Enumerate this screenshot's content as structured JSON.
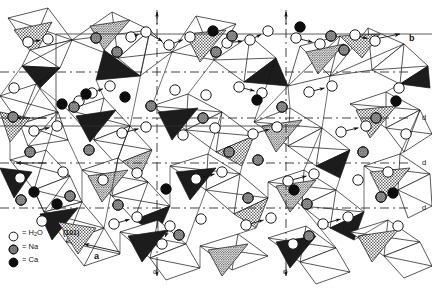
{
  "figure": {
    "type": "crystal-structure-projection",
    "width": 432,
    "height": 291,
    "background": "#ffffff",
    "line_color": "#111111"
  },
  "axes": {
    "a_label": "a",
    "b_label": "b",
    "a_position": {
      "x": 94,
      "y": 258
    },
    "b_position": {
      "x": 409,
      "y": 38
    }
  },
  "face_label": {
    "text": "(101)",
    "x": 67,
    "y": 232
  },
  "glide_labels": {
    "label": "d",
    "right_edge": [
      {
        "x": 422,
        "y": 68
      },
      {
        "x": 422,
        "y": 114
      },
      {
        "x": 422,
        "y": 159
      },
      {
        "x": 422,
        "y": 204
      }
    ],
    "bottom_edge": [
      {
        "x": 153,
        "y": 268
      },
      {
        "x": 283,
        "y": 268
      }
    ]
  },
  "glide_lines": {
    "horizontal_y": [
      72,
      118,
      163,
      208
    ],
    "vertical_x": [
      157,
      286
    ],
    "dash_pattern": "9 4 2 4",
    "color": "#222222"
  },
  "arrows": {
    "left_pointing": [
      {
        "x": 20,
        "y": 118
      },
      {
        "x": 20,
        "y": 163
      }
    ],
    "down_pointing": [
      {
        "x": 157,
        "y": 282
      },
      {
        "x": 286,
        "y": 282
      }
    ],
    "up_tick": [
      {
        "x": 157,
        "y": 14
      },
      {
        "x": 286,
        "y": 14
      }
    ]
  },
  "legend": {
    "items": [
      {
        "symbol": "open-circle",
        "eq": "=",
        "label": "H",
        "sub": "2",
        "label_tail": "O",
        "fill": "#ffffff",
        "stroke": "#111111"
      },
      {
        "symbol": "stippled-circle",
        "eq": "=",
        "label": "Na",
        "sub": "",
        "label_tail": "",
        "fill": "#5a5a5a",
        "stroke": "#111111"
      },
      {
        "symbol": "filled-circle",
        "eq": "=",
        "label": "Ca",
        "sub": "",
        "label_tail": "",
        "fill": "#0d0d0d",
        "stroke": "#0d0d0d"
      }
    ]
  },
  "atoms": {
    "h2o_color": "#ffffff",
    "na_color": "#555555",
    "ca_color": "#0d0d0d",
    "radius": 5.2,
    "h2o": [
      {
        "x": 28,
        "y": 42
      },
      {
        "x": 48,
        "y": 39
      },
      {
        "x": 79,
        "y": 101
      },
      {
        "x": 131,
        "y": 37
      },
      {
        "x": 146,
        "y": 32
      },
      {
        "x": 169,
        "y": 45
      },
      {
        "x": 190,
        "y": 37
      },
      {
        "x": 227,
        "y": 43
      },
      {
        "x": 250,
        "y": 40
      },
      {
        "x": 268,
        "y": 31
      },
      {
        "x": 296,
        "y": 38
      },
      {
        "x": 320,
        "y": 44
      },
      {
        "x": 355,
        "y": 35
      },
      {
        "x": 375,
        "y": 41
      },
      {
        "x": 14,
        "y": 88
      },
      {
        "x": 92,
        "y": 93
      },
      {
        "x": 110,
        "y": 86
      },
      {
        "x": 175,
        "y": 90
      },
      {
        "x": 206,
        "y": 95
      },
      {
        "x": 239,
        "y": 87
      },
      {
        "x": 262,
        "y": 93
      },
      {
        "x": 309,
        "y": 92
      },
      {
        "x": 332,
        "y": 86
      },
      {
        "x": 399,
        "y": 88
      },
      {
        "x": 34,
        "y": 131
      },
      {
        "x": 57,
        "y": 126
      },
      {
        "x": 122,
        "y": 133
      },
      {
        "x": 146,
        "y": 127
      },
      {
        "x": 183,
        "y": 135
      },
      {
        "x": 215,
        "y": 128
      },
      {
        "x": 253,
        "y": 134
      },
      {
        "x": 277,
        "y": 127
      },
      {
        "x": 341,
        "y": 132
      },
      {
        "x": 366,
        "y": 126
      },
      {
        "x": 406,
        "y": 134
      },
      {
        "x": 20,
        "y": 178
      },
      {
        "x": 63,
        "y": 172
      },
      {
        "x": 103,
        "y": 180
      },
      {
        "x": 137,
        "y": 173
      },
      {
        "x": 196,
        "y": 179
      },
      {
        "x": 222,
        "y": 172
      },
      {
        "x": 288,
        "y": 181
      },
      {
        "x": 314,
        "y": 174
      },
      {
        "x": 358,
        "y": 180
      },
      {
        "x": 388,
        "y": 172
      },
      {
        "x": 42,
        "y": 221
      },
      {
        "x": 114,
        "y": 224
      },
      {
        "x": 137,
        "y": 217
      },
      {
        "x": 170,
        "y": 226
      },
      {
        "x": 201,
        "y": 219
      },
      {
        "x": 246,
        "y": 225
      },
      {
        "x": 271,
        "y": 218
      },
      {
        "x": 323,
        "y": 224
      },
      {
        "x": 348,
        "y": 217
      },
      {
        "x": 398,
        "y": 226
      },
      {
        "x": 162,
        "y": 244
      },
      {
        "x": 293,
        "y": 244
      }
    ],
    "na": [
      {
        "x": 96,
        "y": 38
      },
      {
        "x": 117,
        "y": 52
      },
      {
        "x": 232,
        "y": 36
      },
      {
        "x": 216,
        "y": 52
      },
      {
        "x": 344,
        "y": 50
      },
      {
        "x": 331,
        "y": 36
      },
      {
        "x": 13,
        "y": 117
      },
      {
        "x": 74,
        "y": 107
      },
      {
        "x": 151,
        "y": 106
      },
      {
        "x": 203,
        "y": 118
      },
      {
        "x": 282,
        "y": 107
      },
      {
        "x": 376,
        "y": 118
      },
      {
        "x": 30,
        "y": 152
      },
      {
        "x": 89,
        "y": 150
      },
      {
        "x": 229,
        "y": 152
      },
      {
        "x": 258,
        "y": 160
      },
      {
        "x": 363,
        "y": 152
      },
      {
        "x": 21,
        "y": 200
      },
      {
        "x": 70,
        "y": 196
      },
      {
        "x": 118,
        "y": 205
      },
      {
        "x": 248,
        "y": 198
      },
      {
        "x": 307,
        "y": 204
      },
      {
        "x": 381,
        "y": 197
      },
      {
        "x": 179,
        "y": 235
      },
      {
        "x": 309,
        "y": 236
      }
    ],
    "ca": [
      {
        "x": 86,
        "y": 94
      },
      {
        "x": 62,
        "y": 104
      },
      {
        "x": 213,
        "y": 31
      },
      {
        "x": 300,
        "y": 27
      },
      {
        "x": 396,
        "y": 101
      },
      {
        "x": 34,
        "y": 192
      },
      {
        "x": 57,
        "y": 204
      },
      {
        "x": 166,
        "y": 189
      },
      {
        "x": 294,
        "y": 190
      },
      {
        "x": 393,
        "y": 193
      },
      {
        "x": 125,
        "y": 97
      },
      {
        "x": 257,
        "y": 100
      }
    ]
  },
  "polyhedra": {
    "dark_fill": "#1c1c1c",
    "stipple_fill": "#6f6f6f",
    "light_fill": "#ffffff",
    "edge_color": "#111111",
    "note": "corner-linked tetrahedra and octahedra drawn in projection; shaded faces indicate downward-facing triangles"
  }
}
